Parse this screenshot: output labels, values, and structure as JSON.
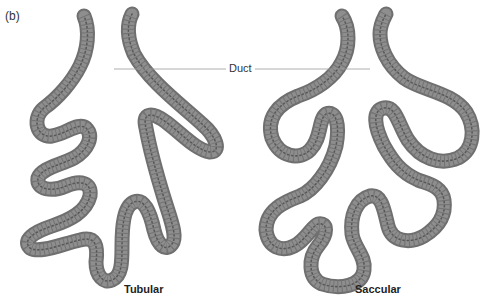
{
  "figure": {
    "panel_label": "(b)",
    "duct_label": "Duct",
    "captions": {
      "tubular": "Tubular",
      "saccular": "Saccular"
    },
    "colors": {
      "background": "#ffffff",
      "tube_edge": "#6f6f6f",
      "tube_fill": "#8e8e8e",
      "leader_line": "#9a9a9a",
      "text": "#333333"
    }
  }
}
